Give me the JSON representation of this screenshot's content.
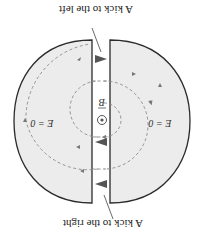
{
  "figure": {
    "orientation_deg": 180,
    "labels": {
      "kick_left": "A kick to the left",
      "kick_right": "A kick to the right",
      "field_left": "E = 0",
      "field_right": "E = 0",
      "magnetic_field": "B"
    },
    "colors": {
      "dee_fill": "#ececec",
      "dee_stroke": "#2b2b2b",
      "trajectory": "#8a8a8a",
      "arrow": "#555555",
      "text": "#222222"
    },
    "icons": {
      "field_out_of_page": "dot-in-circle-icon",
      "kick_arrows": "triangle-arrow-icon"
    }
  }
}
